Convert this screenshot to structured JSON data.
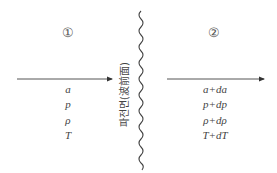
{
  "diagram": {
    "type": "shock/wave front schematic",
    "regions": [
      {
        "id": "region-1",
        "number_label": "①",
        "variables": [
          "a",
          "p",
          "ρ",
          "T"
        ]
      },
      {
        "id": "region-2",
        "number_label": "②",
        "variables": [
          "a+da",
          "p+dp",
          "ρ+dρ",
          "T+dT"
        ]
      }
    ],
    "wave_front_label": "파전면(波前面)",
    "arrows": [
      {
        "from": "left",
        "to": "wave front",
        "direction": "right"
      },
      {
        "from": "wave front",
        "to": "right edge",
        "direction": "right"
      }
    ],
    "colors": {
      "line": "#444444",
      "text": "#444444"
    }
  }
}
